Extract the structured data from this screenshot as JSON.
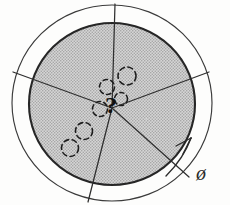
{
  "figure": {
    "center_symbol": "?",
    "angle_label": "ø",
    "background_color": "#fdfdfc",
    "ink_color": "#2b2b2b",
    "shaded_fill_color": "#c9c9c9",
    "hatch_color": "#9a9a9a"
  },
  "outer_circle": {
    "name": "outer-boundary-circle",
    "cx": 112,
    "cy": 103,
    "r": 99,
    "stroke_width": 1.1,
    "fill": "none"
  },
  "inner_disk": {
    "name": "shaded-inner-disk",
    "cx": 112,
    "cy": 104,
    "r": 82,
    "stroke_width": 2.0,
    "fill": "hatched-gray"
  },
  "center_point": {
    "cx": 112,
    "cy": 108
  },
  "spokes": [
    {
      "label": "spoke-up",
      "angle_deg": -88,
      "length": 104
    },
    {
      "label": "spoke-upper-right",
      "angle_deg": -28,
      "length": 101
    },
    {
      "label": "spoke-lower-right",
      "angle_deg": 42,
      "length": 103
    },
    {
      "label": "spoke-down",
      "angle_deg": 104,
      "length": 104
    },
    {
      "label": "spoke-upper-left",
      "angle_deg": -158,
      "length": 104
    }
  ],
  "dashed_circles": [
    {
      "label": "orbit-marker-1",
      "cx": 120,
      "cy": 100,
      "r": 7
    },
    {
      "label": "orbit-marker-2",
      "cx": 100,
      "cy": 108,
      "r": 8
    },
    {
      "label": "orbit-marker-3",
      "cx": 107,
      "cy": 87,
      "r": 8
    },
    {
      "label": "orbit-marker-4",
      "cx": 126,
      "cy": 76,
      "r": 10
    },
    {
      "label": "orbit-marker-5",
      "cx": 83,
      "cy": 131,
      "r": 9
    },
    {
      "label": "orbit-marker-6",
      "cx": 70,
      "cy": 148,
      "r": 9
    }
  ],
  "direction_arrow": {
    "label": "rotation-direction-arrow",
    "tip_x": 190,
    "tip_y": 139,
    "tail_x": 168,
    "tail_y": 172,
    "description": "arrow along outer circle indicating direction of increasing angle"
  },
  "annotations": {
    "phi": "ø",
    "question": "?"
  }
}
